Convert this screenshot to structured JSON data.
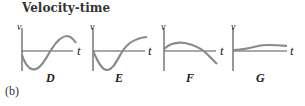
{
  "title": "Velocity-time",
  "panel_tag": "(b)",
  "axis_labels": {
    "y": "v",
    "x": "t"
  },
  "curve_color": "#8a8a8a",
  "axis_color": "#555555",
  "graphs": [
    {
      "id": "D",
      "label": "D"
    },
    {
      "id": "E",
      "label": "E"
    },
    {
      "id": "F",
      "label": "F"
    },
    {
      "id": "G",
      "label": "G"
    }
  ]
}
